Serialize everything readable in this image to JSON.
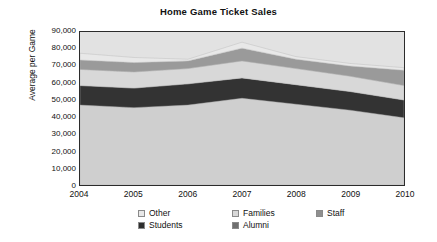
{
  "chart_data": {
    "type": "area",
    "title": "Home Game Ticket Sales",
    "xlabel": "",
    "ylabel": "Average per Game",
    "x": [
      2004,
      2005,
      2006,
      2007,
      2008,
      2009,
      2010
    ],
    "categories": [
      "2004",
      "2005",
      "2006",
      "2007",
      "2008",
      "2009",
      "2010"
    ],
    "ylim": [
      0,
      90000
    ],
    "ytick_values": [
      0,
      10000,
      20000,
      30000,
      40000,
      50000,
      60000,
      70000,
      80000,
      90000
    ],
    "ytick_labels": [
      "0",
      "10,000",
      "20,000",
      "30,000",
      "40,000",
      "50,000",
      "60,000",
      "70,000",
      "80,000",
      "90,000"
    ],
    "grid": false,
    "stacked": true,
    "legend_position": "bottom",
    "stack_order_bottom_to_top": [
      "Students",
      "Alumni",
      "Staff",
      "Families",
      "Other"
    ],
    "series": [
      {
        "name": "Students",
        "color": "#cfcfcf",
        "values": [
          47000,
          45500,
          47000,
          51000,
          47500,
          44000,
          39500
        ]
      },
      {
        "name": "Alumni",
        "color": "#333333",
        "values": [
          11500,
          11500,
          12500,
          12000,
          11500,
          11000,
          10500
        ]
      },
      {
        "name": "Staff",
        "color": "#d8d8d8",
        "values": [
          9500,
          9500,
          9000,
          10000,
          9500,
          9000,
          8500
        ]
      },
      {
        "name": "Families",
        "color": "#9a9a9a",
        "values": [
          5500,
          5500,
          4500,
          7500,
          5500,
          6000,
          9000
        ]
      },
      {
        "name": "Other",
        "color": "#e8e8e8",
        "values": [
          4000,
          3000,
          1000,
          3500,
          1500,
          1500,
          1500
        ]
      }
    ],
    "totals": [
      77500,
      75000,
      74000,
      84000,
      75500,
      71500,
      69000
    ]
  },
  "legend": {
    "items": [
      {
        "label": "Other",
        "color": "#e8e8e8"
      },
      {
        "label": "Families",
        "color": "#d8d8d8"
      },
      {
        "label": "Staff",
        "color": "#8f8f8f"
      },
      {
        "label": "Students",
        "color": "#2e2e2e"
      },
      {
        "label": "Alumni",
        "color": "#6f6f6f"
      }
    ]
  },
  "colors": {
    "plot_background": "#e2e2e2",
    "frame": "#2b2b2b",
    "page_background": "#ffffff",
    "text": "#111111"
  }
}
